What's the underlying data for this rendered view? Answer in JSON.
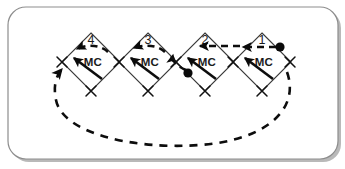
{
  "figure": {
    "panel": {
      "border_color": "#8d8d8d",
      "background_color": "#ffffff",
      "shadow_color": "#b9b9b9",
      "corner_radius": 18
    },
    "machine_label": "MC",
    "places": [
      {
        "id": "place-4",
        "number": "4",
        "machine": "MC",
        "cx": 91,
        "cy": 62,
        "has_token": false
      },
      {
        "id": "place-3",
        "number": "3",
        "machine": "MC",
        "cx": 148,
        "cy": 62,
        "has_token": false
      },
      {
        "id": "place-2",
        "number": "2",
        "machine": "MC",
        "cx": 205,
        "cy": 62,
        "has_token": false
      },
      {
        "id": "place-1",
        "number": "1",
        "machine": "MC",
        "cx": 262,
        "cy": 62,
        "has_token": true
      }
    ],
    "tokens": [
      {
        "id": "token-place-1",
        "cx": 280,
        "cy": 47,
        "r": 4.6
      },
      {
        "id": "token-place-2",
        "cx": 188,
        "cy": 73,
        "r": 4.6
      }
    ],
    "transitions": [
      {
        "id": "transition-left-4",
        "cx": 62,
        "cy": 62
      },
      {
        "id": "transition-mid-43",
        "cx": 119,
        "cy": 62
      },
      {
        "id": "transition-mid-32",
        "cx": 176,
        "cy": 62
      },
      {
        "id": "transition-mid-21",
        "cx": 233,
        "cy": 62
      },
      {
        "id": "transition-right-1",
        "cx": 290,
        "cy": 62
      },
      {
        "id": "transition-bottom-4",
        "cx": 91,
        "cy": 91
      },
      {
        "id": "transition-bottom-3",
        "cx": 148,
        "cy": 91
      },
      {
        "id": "transition-bottom-2",
        "cx": 205,
        "cy": 91
      },
      {
        "id": "transition-bottom-1",
        "cx": 262,
        "cy": 91
      }
    ],
    "arcs": {
      "solid_count": 4,
      "dashed_count": 4,
      "feedback_arc": {
        "id": "feedback-arc",
        "from": "transition-left-4",
        "to": "transition-right-1",
        "style": "dashed"
      }
    },
    "colors": {
      "ink": "#0d0d0d",
      "place_outline": "#3a3a3a",
      "token": "#0a0a0a"
    }
  }
}
